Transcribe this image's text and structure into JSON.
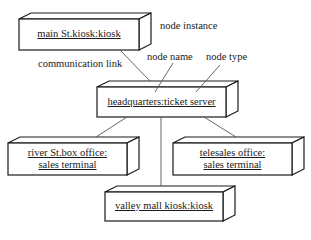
{
  "diagram": {
    "type": "UML deployment diagram",
    "nodes": [
      {
        "id": "main",
        "label": "main St.kiosk:kiosk"
      },
      {
        "id": "hq",
        "label": "headquarters:ticket server"
      },
      {
        "id": "river",
        "label_line1": "river St.box office:",
        "label_line2": "sales terminal"
      },
      {
        "id": "tele",
        "label_line1": "telesales office:",
        "label_line2": "sales terminal"
      },
      {
        "id": "valley",
        "label": "valley mall kiosk:kiosk"
      }
    ],
    "annotations": {
      "node_instance": "node instance",
      "communication_link": "communication link",
      "node_name": "node name",
      "node_type": "node type"
    },
    "links": [
      {
        "from": "main",
        "to": "hq"
      },
      {
        "from": "hq",
        "to": "river"
      },
      {
        "from": "hq",
        "to": "tele"
      },
      {
        "from": "hq",
        "to": "valley"
      }
    ]
  }
}
